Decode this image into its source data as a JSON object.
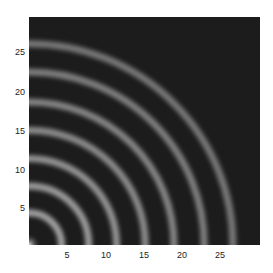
{
  "chart_data": {
    "type": "heatmap",
    "title": "",
    "xlabel": "",
    "ylabel": "",
    "xlim": [
      0,
      29
    ],
    "ylim": [
      0,
      29
    ],
    "x_ticks": [
      5,
      10,
      15,
      20,
      25
    ],
    "y_ticks": [
      5,
      10,
      15,
      20,
      25
    ],
    "grid": false,
    "legend": null,
    "colormap": "gray",
    "ring_center": [
      0,
      0
    ],
    "ring_radii": [
      4.1,
      7.5,
      11.0,
      14.6,
      18.2,
      22.0,
      25.6
    ],
    "ring_period": 3.6,
    "background_color": "#1c1c1c",
    "ring_color": "#a8a8a8"
  },
  "axes": {
    "x_tick_labels": [
      "5",
      "10",
      "15",
      "20",
      "25"
    ],
    "y_tick_labels": [
      "25",
      "20",
      "15",
      "10",
      "5"
    ]
  }
}
